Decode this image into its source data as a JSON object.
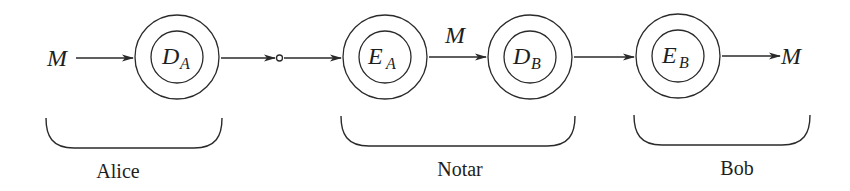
{
  "diagram": {
    "type": "encryption-flow",
    "colors": {
      "stroke": "#2a2a2a",
      "text": "#1e1e1e",
      "background": "#ffffff"
    },
    "input_message": "M",
    "output_message": "M",
    "middle_message": "M",
    "nodes": [
      {
        "id": "DA",
        "base": "D",
        "sub": "A"
      },
      {
        "id": "EA",
        "base": "E",
        "sub": "A"
      },
      {
        "id": "DB",
        "base": "D",
        "sub": "B"
      },
      {
        "id": "EB",
        "base": "E",
        "sub": "B"
      }
    ],
    "groups": [
      {
        "label": "Alice"
      },
      {
        "label": "Notar"
      },
      {
        "label": "Bob"
      }
    ]
  }
}
